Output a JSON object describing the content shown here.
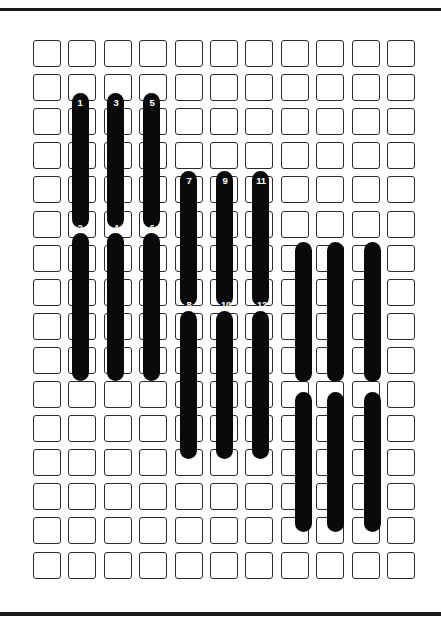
{
  "figure": {
    "title": "",
    "type": "patent-line-drawing",
    "canvas": {
      "width": 441,
      "height": 626,
      "background": "#ffffff"
    },
    "ink_color": "#0a0a0a",
    "line_color": "#2b2b2b",
    "label_color": "#ffffff"
  },
  "page_rules": [
    {
      "name": "top-rule",
      "x": 0,
      "y": 8,
      "width": 441,
      "height": 3
    },
    {
      "name": "bottom-rule",
      "x": 0,
      "y": 612,
      "width": 441,
      "height": 4
    }
  ],
  "grid": {
    "origin_x": 33,
    "origin_y": 40,
    "columns": 11,
    "rows": 16,
    "col_pitch": 35.4,
    "row_pitch": 34.1,
    "cell_width": 28,
    "cell_height": 27,
    "cell_radius": 3,
    "stroke": 1.4
  },
  "bars": [
    {
      "name": "bar-1",
      "column": 2,
      "x": 72,
      "y": 93,
      "width": 17,
      "height": 135
    },
    {
      "name": "bar-2",
      "column": 2,
      "x": 72,
      "y": 233,
      "width": 17,
      "height": 148
    },
    {
      "name": "bar-3",
      "column": 3,
      "x": 107,
      "y": 93,
      "width": 17,
      "height": 135
    },
    {
      "name": "bar-4",
      "column": 3,
      "x": 107,
      "y": 233,
      "width": 17,
      "height": 148
    },
    {
      "name": "bar-5",
      "column": 4,
      "x": 143,
      "y": 93,
      "width": 17,
      "height": 135
    },
    {
      "name": "bar-6",
      "column": 4,
      "x": 143,
      "y": 233,
      "width": 17,
      "height": 148
    },
    {
      "name": "bar-7",
      "column": 5,
      "x": 180,
      "y": 171,
      "width": 17,
      "height": 135
    },
    {
      "name": "bar-8",
      "column": 5,
      "x": 180,
      "y": 311,
      "width": 17,
      "height": 148
    },
    {
      "name": "bar-9",
      "column": 6,
      "x": 216,
      "y": 171,
      "width": 17,
      "height": 135
    },
    {
      "name": "bar-10",
      "column": 6,
      "x": 216,
      "y": 311,
      "width": 17,
      "height": 148
    },
    {
      "name": "bar-11",
      "column": 7,
      "x": 252,
      "y": 171,
      "width": 17,
      "height": 135
    },
    {
      "name": "bar-12",
      "column": 7,
      "x": 252,
      "y": 311,
      "width": 17,
      "height": 148
    },
    {
      "name": "bar-13",
      "column": 8,
      "x": 295,
      "y": 242,
      "width": 17,
      "height": 140
    },
    {
      "name": "bar-14",
      "column": 8,
      "x": 295,
      "y": 392,
      "width": 17,
      "height": 140
    },
    {
      "name": "bar-15",
      "column": 9,
      "x": 327,
      "y": 242,
      "width": 17,
      "height": 140
    },
    {
      "name": "bar-16",
      "column": 9,
      "x": 327,
      "y": 392,
      "width": 17,
      "height": 140
    },
    {
      "name": "bar-17",
      "column": 10,
      "x": 364,
      "y": 242,
      "width": 17,
      "height": 140
    },
    {
      "name": "bar-18",
      "column": 10,
      "x": 364,
      "y": 392,
      "width": 17,
      "height": 140
    }
  ],
  "callouts": [
    {
      "name": "callout-1",
      "text": "1",
      "x": 80,
      "y": 103
    },
    {
      "name": "callout-2",
      "text": "2",
      "x": 80,
      "y": 228
    },
    {
      "name": "callout-3",
      "text": "3",
      "x": 116,
      "y": 103
    },
    {
      "name": "callout-4",
      "text": "4",
      "x": 116,
      "y": 228
    },
    {
      "name": "callout-5",
      "text": "5",
      "x": 152,
      "y": 103
    },
    {
      "name": "callout-6",
      "text": "6",
      "x": 152,
      "y": 228
    },
    {
      "name": "callout-7",
      "text": "7",
      "x": 189,
      "y": 181
    },
    {
      "name": "callout-8",
      "text": "8",
      "x": 189,
      "y": 305
    },
    {
      "name": "callout-9",
      "text": "9",
      "x": 225,
      "y": 181
    },
    {
      "name": "callout-10",
      "text": "10",
      "x": 226,
      "y": 305
    },
    {
      "name": "callout-11",
      "text": "11",
      "x": 261,
      "y": 181
    },
    {
      "name": "callout-12",
      "text": "12",
      "x": 262,
      "y": 305
    }
  ]
}
